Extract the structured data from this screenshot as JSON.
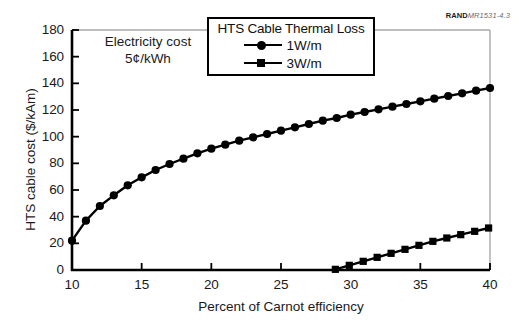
{
  "figure": {
    "rand_id_bold": "RAND",
    "rand_id_rest": "MR1531-4.3",
    "annotation_line1": "Electricity cost",
    "annotation_line2": "5¢/kWh"
  },
  "legend": {
    "title": "HTS Cable Thermal Loss",
    "entries": [
      {
        "label": "1W/m",
        "marker": "circle-marker-icon",
        "color": "#000000"
      },
      {
        "label": "3W/m",
        "marker": "square-marker-icon",
        "color": "#000000"
      }
    ]
  },
  "chart_data": {
    "type": "line",
    "title": "",
    "xlabel": "Percent of Carnot efficiency",
    "ylabel": "HTS cable cost ($/kAm)",
    "xlim": [
      10,
      40
    ],
    "ylim": [
      0,
      180
    ],
    "xticks": [
      10,
      15,
      20,
      25,
      30,
      35,
      40
    ],
    "xtick_labels": [
      "10",
      "15",
      "20",
      "25",
      "30",
      "35",
      "40"
    ],
    "yticks": [
      0,
      20,
      40,
      60,
      80,
      100,
      120,
      140,
      160,
      180
    ],
    "ytick_labels": [
      "0",
      "20",
      "40",
      "60",
      "80",
      "100",
      "120",
      "140",
      "160",
      "180"
    ],
    "grid": false,
    "legend_position": "top-center",
    "annotations": [
      {
        "text": "Electricity cost 5¢/kWh",
        "x": 13.5,
        "y": 163
      },
      {
        "text": "RANDMR1531-4.3",
        "x": 38.5,
        "y": 190
      }
    ],
    "series": [
      {
        "name": "1W/m",
        "marker": "circle",
        "color": "#000000",
        "x": [
          10,
          11,
          12,
          13,
          14,
          15,
          16,
          17,
          18,
          19,
          20,
          21,
          22,
          23,
          24,
          25,
          26,
          27,
          28,
          29,
          30,
          31,
          32,
          33,
          34,
          35,
          36,
          37,
          38,
          39,
          40
        ],
        "y": [
          22,
          37,
          48,
          56,
          63.5,
          69.5,
          75,
          79.5,
          83.5,
          87.5,
          91,
          94,
          97,
          99.5,
          102,
          104.5,
          107,
          109.5,
          112,
          114,
          116.5,
          118.5,
          120.5,
          122.5,
          124.5,
          126.5,
          128.5,
          130.5,
          132.5,
          134.5,
          136.5
        ]
      },
      {
        "name": "3W/m",
        "marker": "square",
        "color": "#000000",
        "x": [
          28.9,
          29.9,
          30.9,
          31.9,
          32.9,
          33.9,
          34.9,
          35.9,
          36.9,
          37.9,
          38.9,
          39.9
        ],
        "y": [
          0.5,
          3.5,
          6.5,
          9.5,
          12.5,
          15.5,
          18.5,
          21.5,
          24,
          26.5,
          29,
          31.5
        ]
      }
    ]
  }
}
